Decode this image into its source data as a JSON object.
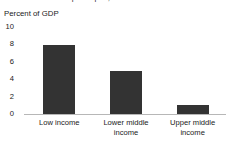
{
  "figure": {
    "clipped_title": "Net ODA received per capita, 2002-03",
    "unit_caption": "Percent of GDP",
    "background_color": "#ffffff",
    "bar_color": "#333333",
    "baseline_color": "#b7b7b7"
  },
  "chart_data": {
    "type": "bar",
    "title": "",
    "xlabel": "",
    "ylabel": "Percent of GDP",
    "ylim": [
      0,
      10
    ],
    "yticks": [
      0,
      2,
      4,
      6,
      8,
      10
    ],
    "ytick_labels": [
      "0",
      "2",
      "4",
      "6",
      "8",
      "10"
    ],
    "grid": false,
    "legend": false,
    "categories": [
      "Low income",
      "Lower middle income",
      "Upper middle income"
    ],
    "category_lines": [
      [
        "Low income"
      ],
      [
        "Lower middle",
        "income"
      ],
      [
        "Upper middle",
        "income"
      ]
    ],
    "values": [
      7.9,
      5.0,
      1.0
    ],
    "series": [
      {
        "name": "Percent of GDP",
        "values": [
          7.9,
          5.0,
          1.0
        ]
      }
    ]
  }
}
